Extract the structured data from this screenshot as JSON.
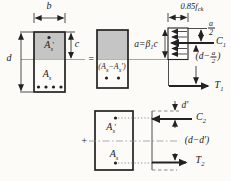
{
  "colors": {
    "ink": "#222222",
    "paper": "#fcfbf8",
    "grayfill": "#c5c5c5",
    "faint": "#8f8f8f"
  },
  "labels": {
    "b": "b",
    "d": "d",
    "c": "c",
    "equals": "=",
    "plus": "+",
    "d_prime": "d′",
    "d_minus_dprime": "(d−d′)",
    "As": {
      "base": "A",
      "sub": "s"
    },
    "AsPrime": {
      "base": "A",
      "sub": "s",
      "prime": "′"
    },
    "AsDiff": {
      "p1": "(A",
      "s1": "s",
      "p2": "−A",
      "s2": "s",
      "p3": "′)"
    },
    "aEq": {
      "p1": "a=β",
      "s1": "1",
      "p2": "c"
    },
    "stress": {
      "p1": "0.85f",
      "s1": "ck"
    },
    "fracA2": {
      "num": "a",
      "den": "2"
    },
    "dMinusA2": {
      "p1": "(d−",
      "p2": ")"
    },
    "C1": {
      "base": "C",
      "sub": "1"
    },
    "T1": {
      "base": "T",
      "sub": "1"
    },
    "C2": {
      "base": "C",
      "sub": "2"
    },
    "T2": {
      "base": "T",
      "sub": "2"
    }
  }
}
